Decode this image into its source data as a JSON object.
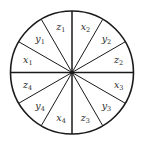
{
  "diagram": {
    "type": "sector-wheel",
    "sector_count": 12,
    "center": [
      72,
      72.5
    ],
    "radius": 61.5,
    "stroke_color": "#1a1a1a",
    "background": "#ffffff",
    "label_radius": 47,
    "sectors": [
      {
        "index": 0,
        "label": "x",
        "sub": "2",
        "angle_mid": 15
      },
      {
        "index": 1,
        "label": "y",
        "sub": "2",
        "angle_mid": 45
      },
      {
        "index": 2,
        "label": "z",
        "sub": "2",
        "angle_mid": 75
      },
      {
        "index": 3,
        "label": "x",
        "sub": "3",
        "angle_mid": 105
      },
      {
        "index": 4,
        "label": "y",
        "sub": "3",
        "angle_mid": 135
      },
      {
        "index": 5,
        "label": "z",
        "sub": "3",
        "angle_mid": 165
      },
      {
        "index": 6,
        "label": "x",
        "sub": "4",
        "angle_mid": 195
      },
      {
        "index": 7,
        "label": "y",
        "sub": "4",
        "angle_mid": 225
      },
      {
        "index": 8,
        "label": "z",
        "sub": "4",
        "angle_mid": 255
      },
      {
        "index": 9,
        "label": "x",
        "sub": "1",
        "angle_mid": 285
      },
      {
        "index": 10,
        "label": "y",
        "sub": "1",
        "angle_mid": 315
      },
      {
        "index": 11,
        "label": "z",
        "sub": "1",
        "angle_mid": 345
      }
    ]
  }
}
